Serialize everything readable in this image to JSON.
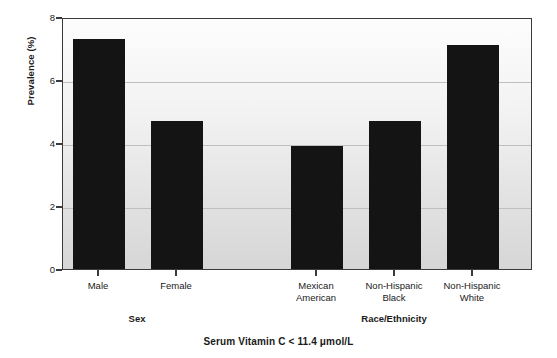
{
  "chart_data": {
    "type": "bar",
    "title": "",
    "caption": "Serum Vitamin C < 11.4 μmol/L",
    "xlabel": "",
    "ylabel": "Prevalence (%)",
    "ylim": [
      0,
      8
    ],
    "yticks": [
      0,
      2,
      4,
      6,
      8
    ],
    "ytick_labels": [
      "0",
      "2",
      "4",
      "6",
      "8"
    ],
    "grid": true,
    "legend": "none",
    "categories": [
      "Male",
      "Female",
      "Mexican American",
      "Non-Hispanic Black",
      "Non-Hispanic White"
    ],
    "values": [
      7.3,
      4.7,
      3.9,
      4.7,
      7.1
    ],
    "bar_color": "#141414",
    "groups": [
      {
        "label": "Sex",
        "categories": [
          "Male",
          "Female"
        ]
      },
      {
        "label": "Race/Ethnicity",
        "categories": [
          "Mexican American",
          "Non-Hispanic Black",
          "Non-Hispanic White"
        ]
      }
    ]
  },
  "axis": {
    "y_title": "Prevalence (%)",
    "ticks": [
      {
        "label": "8",
        "value": 8
      },
      {
        "label": "6",
        "value": 6
      },
      {
        "label": "4",
        "value": 4
      },
      {
        "label": "2",
        "value": 2
      },
      {
        "label": "0",
        "value": 0
      }
    ]
  },
  "bars": [
    {
      "name": "Male",
      "value": 7.3,
      "line1": "Male",
      "line2": ""
    },
    {
      "name": "Female",
      "value": 4.7,
      "line1": "Female",
      "line2": ""
    },
    {
      "name": "Mexican American",
      "value": 3.9,
      "line1": "Mexican",
      "line2": "American"
    },
    {
      "name": "Non-Hispanic Black",
      "value": 4.7,
      "line1": "Non-Hispanic",
      "line2": "Black"
    },
    {
      "name": "Non-Hispanic White",
      "value": 7.1,
      "line1": "Non-Hispanic",
      "line2": "White"
    }
  ],
  "groups": [
    {
      "label": "Sex"
    },
    {
      "label": "Race/Ethnicity"
    }
  ],
  "caption": "Serum Vitamin C < 11.4 μmol/L"
}
